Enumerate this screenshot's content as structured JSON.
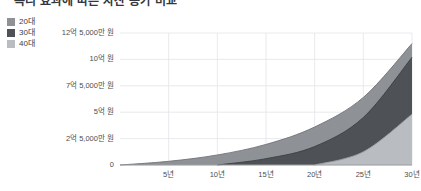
{
  "title": "복리 효과에 따른 자산 증가 비교",
  "legend": {
    "items": [
      {
        "label": "20대",
        "color": "#8e9196"
      },
      {
        "label": "30대",
        "color": "#4e5155"
      },
      {
        "label": "40대",
        "color": "#b9bcc0"
      }
    ]
  },
  "axes": {
    "y_ticks": [
      "0",
      "2억 5,000만 원",
      "5억 원",
      "7억 5,000만 원",
      "10억 원",
      "12억 5,000만 원"
    ],
    "x_ticks": [
      "5년",
      "10년",
      "15년",
      "20년",
      "25년",
      "30년"
    ]
  },
  "chart_data": {
    "type": "area",
    "title": "복리 효과에 따른 자산 증가 비교",
    "xlabel": "",
    "ylabel": "",
    "grid": true,
    "legend_position": "top-left",
    "x": [
      0,
      5,
      10,
      15,
      20,
      25,
      30
    ],
    "x_unit": "년",
    "xlim": [
      0,
      30
    ],
    "ylim": [
      0,
      1250000000
    ],
    "y_unit": "원",
    "y_tick_values": [
      0,
      250000000,
      500000000,
      750000000,
      1000000000,
      1250000000
    ],
    "y_tick_labels": [
      "0",
      "2억 5,000만 원",
      "5억 원",
      "7억 5,000만 원",
      "10억 원",
      "12억 5,000만 원"
    ],
    "x_tick_values": [
      5,
      10,
      15,
      20,
      25,
      30
    ],
    "x_tick_labels": [
      "5년",
      "10년",
      "15년",
      "20년",
      "25년",
      "30년"
    ],
    "series": [
      {
        "name": "20대",
        "color": "#8e9196",
        "start_year": 0,
        "x": [
          0,
          5,
          10,
          15,
          20,
          25,
          30
        ],
        "values": [
          0,
          35000000,
          95000000,
          195000000,
          360000000,
          640000000,
          1150000000
        ]
      },
      {
        "name": "30대",
        "color": "#4e5155",
        "start_year": 10,
        "x": [
          10,
          15,
          20,
          25,
          30
        ],
        "values": [
          0,
          60000000,
          175000000,
          450000000,
          1020000000
        ]
      },
      {
        "name": "40대",
        "color": "#b9bcc0",
        "start_year": 20,
        "x": [
          20,
          25,
          30
        ],
        "values": [
          0,
          125000000,
          480000000
        ]
      }
    ]
  }
}
